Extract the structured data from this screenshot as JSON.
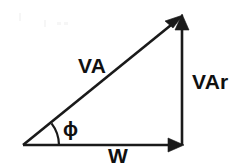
{
  "diagram": {
    "background_color": "#ffffff",
    "stroke_color": "#1a1a1a",
    "text_color": "#101010",
    "vertices": {
      "origin": {
        "x": 23,
        "y": 145
      },
      "apex": {
        "x": 182,
        "y": 16
      },
      "corner": {
        "x": 182,
        "y": 145
      }
    },
    "vectors": [
      {
        "name": "apparent-power",
        "label": "VA",
        "orientation": "diagonal",
        "arrow_at": "apex",
        "label_x": 78,
        "label_y": 73
      },
      {
        "name": "reactive-power",
        "label": "VAr",
        "orientation": "vertical",
        "arrow_at": "apex",
        "label_x": 192,
        "label_y": 89
      },
      {
        "name": "real-power",
        "label": "W",
        "orientation": "horizontal",
        "arrow_at": "corner",
        "label_x": 108,
        "label_y": 163
      }
    ],
    "angle": {
      "name": "phase-angle",
      "label": "ϕ",
      "arc_radius": 36,
      "label_x": 63,
      "label_y": 136
    }
  }
}
